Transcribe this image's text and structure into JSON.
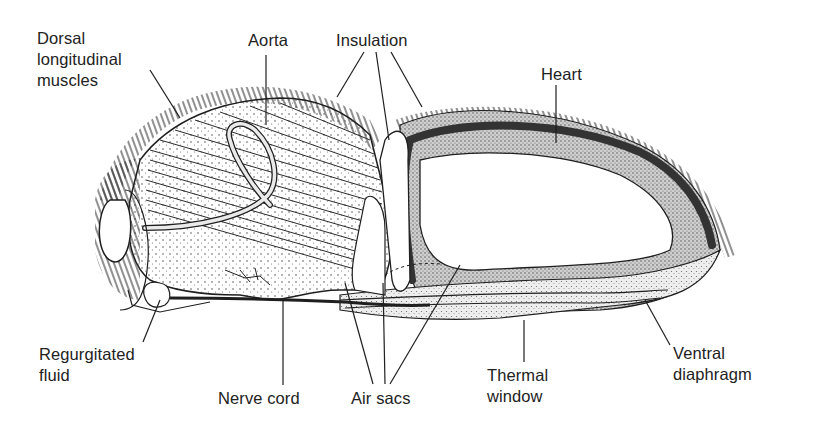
{
  "diagram": {
    "labels": [
      {
        "id": "dorsal-longitudinal-muscles",
        "text": "Dorsal\nlongitudinal\nmuscles",
        "x": 37,
        "y": 30
      },
      {
        "id": "aorta",
        "text": "Aorta",
        "x": 248,
        "y": 30
      },
      {
        "id": "insulation",
        "text": "Insulation",
        "x": 336,
        "y": 30
      },
      {
        "id": "heart",
        "text": "Heart",
        "x": 541,
        "y": 64
      },
      {
        "id": "regurgitated-fluid",
        "text": "Regurgitated\nfluid",
        "x": 39,
        "y": 344
      },
      {
        "id": "nerve-cord",
        "text": "Nerve cord",
        "x": 218,
        "y": 388
      },
      {
        "id": "air-sacs",
        "text": "Air sacs",
        "x": 351,
        "y": 388
      },
      {
        "id": "thermal-window",
        "text": "Thermal\nwindow",
        "x": 487,
        "y": 365
      },
      {
        "id": "ventral-diaphragm",
        "text": "Ventral\ndiaphragm",
        "x": 673,
        "y": 343
      }
    ],
    "colors": {
      "ink": "#1f1f1f",
      "stipple_light": "#d9d9d9",
      "stipple_dark": "#8a8a8a",
      "heart": "#3a3a3a",
      "background": "#ffffff"
    }
  }
}
